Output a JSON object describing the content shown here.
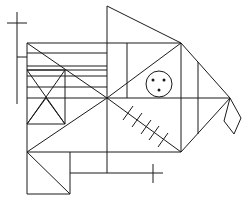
{
  "figure": {
    "stroke_color": "#1a1a1a",
    "background": "#ffffff"
  },
  "lines": [
    [
      17,
      12,
      17,
      104
    ],
    [
      7,
      23,
      27,
      23
    ],
    [
      17,
      57,
      27,
      57
    ],
    [
      27,
      43,
      27,
      194
    ],
    [
      27,
      43,
      181,
      43
    ],
    [
      107,
      6,
      107,
      173
    ],
    [
      107,
      6,
      181,
      43
    ],
    [
      27,
      53,
      107,
      53
    ],
    [
      27,
      66,
      107,
      66
    ],
    [
      27,
      70,
      107,
      70
    ],
    [
      27,
      76,
      107,
      76
    ],
    [
      27,
      87,
      107,
      87
    ],
    [
      27,
      43,
      107,
      98
    ],
    [
      27,
      98,
      230,
      98
    ],
    [
      127,
      43,
      127,
      98
    ],
    [
      107,
      98,
      181,
      43
    ],
    [
      181,
      43,
      181,
      152
    ],
    [
      198,
      62,
      198,
      134
    ],
    [
      181,
      43,
      230,
      98
    ],
    [
      27,
      70,
      65,
      70
    ],
    [
      65,
      70,
      65,
      124
    ],
    [
      27,
      124,
      65,
      124
    ],
    [
      27,
      70,
      65,
      124
    ],
    [
      65,
      70,
      27,
      124
    ],
    [
      27,
      124,
      46,
      98
    ],
    [
      46,
      98,
      65,
      124
    ],
    [
      27,
      152,
      107,
      98
    ],
    [
      107,
      98,
      181,
      152
    ],
    [
      181,
      152,
      230,
      98
    ],
    [
      27,
      152,
      181,
      152
    ],
    [
      27,
      152,
      70,
      194
    ],
    [
      70,
      152,
      70,
      194
    ],
    [
      27,
      194,
      70,
      194
    ],
    [
      70,
      173,
      163,
      173
    ],
    [
      153,
      164,
      153,
      183
    ]
  ],
  "ticks": [
    [
      128,
      113
    ],
    [
      137,
      120
    ],
    [
      146,
      127
    ],
    [
      154,
      133
    ],
    [
      163,
      140
    ]
  ],
  "eye": {
    "cx": 159,
    "cy": 84,
    "r": 13,
    "dots": [
      [
        153,
        80
      ],
      [
        164,
        80
      ],
      [
        159,
        90
      ]
    ]
  },
  "diamond": "230,98 224,121 234,134 241,118"
}
